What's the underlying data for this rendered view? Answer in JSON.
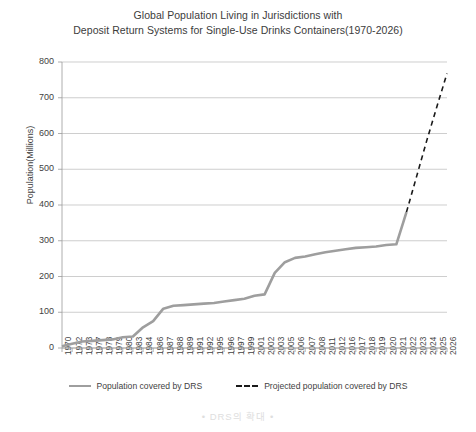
{
  "chart_data": {
    "type": "line",
    "title": "Global Population Living in Jurisdictions with Deposit Return Systems for Single-Use Drinks Containers(1970-2026)",
    "title_lines": [
      "Global Population Living in Jurisdictions with",
      "Deposit Return Systems for Single-Use Drinks Containers(1970-2026)"
    ],
    "xlabel": "",
    "ylabel": "Population(Millions)",
    "ylim": [
      0,
      800
    ],
    "ytick_labels": [
      "0",
      "100",
      "200",
      "300",
      "400",
      "500",
      "600",
      "700",
      "800"
    ],
    "ytick_values": [
      0,
      100,
      200,
      300,
      400,
      500,
      600,
      700,
      800
    ],
    "grid": true,
    "grid_axis": "y",
    "legend_position": "bottom",
    "categories": [
      "1970",
      "1972",
      "1973",
      "1977",
      "1978",
      "1979",
      "1980",
      "1983",
      "1984",
      "1986",
      "1987",
      "1988",
      "1989",
      "1991",
      "1992",
      "1995",
      "1996",
      "1997",
      "1999",
      "2001",
      "2002",
      "2003",
      "2005",
      "2006",
      "2007",
      "2008",
      "2011",
      "2012",
      "2016",
      "2017",
      "2018",
      "2019",
      "2020",
      "2021",
      "2022",
      "2023",
      "2024",
      "2025",
      "2026"
    ],
    "series": [
      {
        "name": "Population covered by DRS",
        "style": "solid",
        "color": "#9e9e9e",
        "values": [
          5,
          12,
          18,
          20,
          22,
          24,
          30,
          32,
          58,
          75,
          110,
          118,
          120,
          122,
          124,
          126,
          130,
          134,
          138,
          146,
          150,
          210,
          240,
          252,
          256,
          262,
          268,
          272,
          276,
          280,
          282,
          284,
          288,
          290,
          380,
          null,
          null,
          null,
          null
        ]
      },
      {
        "name": "Projected population covered by DRS",
        "style": "dashed",
        "color": "#1a1a1a",
        "values": [
          null,
          null,
          null,
          null,
          null,
          null,
          null,
          null,
          null,
          null,
          null,
          null,
          null,
          null,
          null,
          null,
          null,
          null,
          null,
          null,
          null,
          null,
          null,
          null,
          null,
          null,
          null,
          null,
          null,
          null,
          null,
          null,
          null,
          null,
          380,
          480,
          580,
          675,
          768
        ]
      }
    ]
  },
  "legend": {
    "items": [
      {
        "label": "Population covered by DRS",
        "style": "solid"
      },
      {
        "label": "Projected population covered by DRS",
        "style": "dashed"
      }
    ]
  },
  "watermark": {
    "text": "• DRS의 확대 •"
  }
}
